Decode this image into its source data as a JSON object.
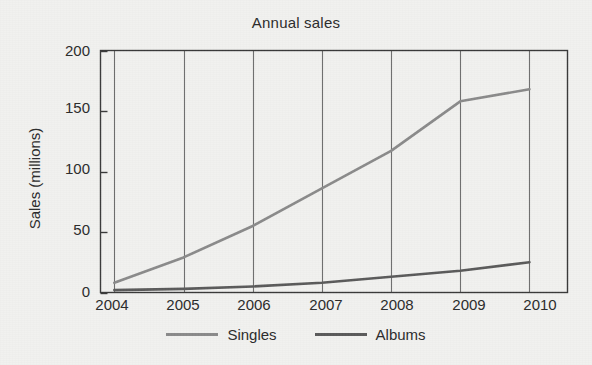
{
  "chart_data": {
    "type": "line",
    "title": "Annual sales",
    "xlabel": "",
    "ylabel": "Sales (millions)",
    "x": [
      2004,
      2005,
      2006,
      2007,
      2008,
      2009,
      2010
    ],
    "categories": [
      "2004",
      "2005",
      "2006",
      "2007",
      "2008",
      "2009",
      "2010"
    ],
    "series": [
      {
        "name": "Singles",
        "color": "#8a8a8a",
        "values": [
          8,
          29,
          55,
          86,
          117,
          158,
          168
        ]
      },
      {
        "name": "Albums",
        "color": "#5a5a5a",
        "values": [
          2,
          3,
          5,
          8,
          13,
          18,
          25
        ]
      }
    ],
    "ylim": [
      0,
      200
    ],
    "yticks": [
      0,
      50,
      100,
      150,
      200
    ],
    "ytick_labels": [
      "0",
      "50",
      "100",
      "150",
      "200"
    ],
    "xlim": [
      2003.8,
      2010.55
    ],
    "grid": "vertical-only",
    "legend_position": "bottom-center"
  },
  "axes": {
    "frame_color": "#3a3a3a",
    "gridline_color": "#6e6e6e",
    "background": "#f1f1ef"
  },
  "legend": {
    "entries": [
      {
        "label": "Singles",
        "swatch_name": "legend-swatch-singles"
      },
      {
        "label": "Albums",
        "swatch_name": "legend-swatch-albums"
      }
    ]
  }
}
